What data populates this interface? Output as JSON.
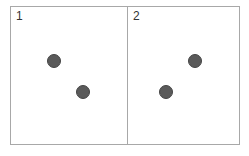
{
  "panels": [
    {
      "label": "1",
      "dots": [
        {
          "x": 54,
          "y": 61
        },
        {
          "x": 83,
          "y": 92
        }
      ]
    },
    {
      "label": "2",
      "dots": [
        {
          "x": 195,
          "y": 61
        },
        {
          "x": 166,
          "y": 92
        }
      ]
    }
  ],
  "colors": {
    "border": "#a8a8a8",
    "dot": "#5a5a5a"
  }
}
